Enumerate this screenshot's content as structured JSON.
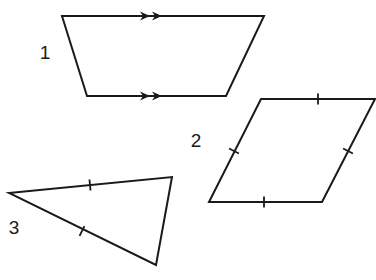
{
  "diagram": {
    "type": "geometry-shapes",
    "stroke_color": "#1a1a1a",
    "label_color": "#1a1a1a",
    "background": "#ffffff",
    "shapes": [
      {
        "id": 1,
        "label": "1",
        "kind": "trapezoid",
        "description": "Quadrilateral with one pair of parallel sides (marked with double arrows)",
        "vertices": [
          [
            62,
            16
          ],
          [
            264,
            16
          ],
          [
            226,
            96
          ],
          [
            87,
            96
          ]
        ],
        "label_pos": [
          45,
          52
        ],
        "parallel_marks": [
          {
            "edge": "top",
            "arrows": [
              [
                145,
                16
              ],
              [
                157,
                16
              ]
            ],
            "direction": "right"
          },
          {
            "edge": "bottom",
            "arrows": [
              [
                145,
                96
              ],
              [
                157,
                96
              ]
            ],
            "direction": "right"
          }
        ]
      },
      {
        "id": 2,
        "label": "2",
        "kind": "rhombus",
        "description": "Quadrilateral with all four sides marked equal (single tick on each side)",
        "vertices": [
          [
            261,
            99
          ],
          [
            375,
            99
          ],
          [
            322,
            202
          ],
          [
            209,
            202
          ]
        ],
        "label_pos": [
          196,
          140
        ],
        "tick_marks": [
          {
            "edge": "top",
            "pos": [
              318,
              99
            ]
          },
          {
            "edge": "right",
            "pos": [
              348,
              151
            ]
          },
          {
            "edge": "bottom",
            "pos": [
              264,
              202
            ]
          },
          {
            "edge": "left",
            "pos": [
              234,
              151
            ]
          }
        ]
      },
      {
        "id": 3,
        "label": "3",
        "kind": "isosceles-triangle",
        "description": "Triangle with two sides marked equal (single tick each)",
        "vertices": [
          [
            9,
            193
          ],
          [
            172,
            177
          ],
          [
            156,
            265
          ]
        ],
        "label_pos": [
          14,
          227
        ],
        "tick_marks": [
          {
            "edge": "top",
            "pos": [
              90,
              185
            ]
          },
          {
            "edge": "lower-left",
            "pos": [
              82,
              231
            ]
          }
        ]
      }
    ]
  }
}
